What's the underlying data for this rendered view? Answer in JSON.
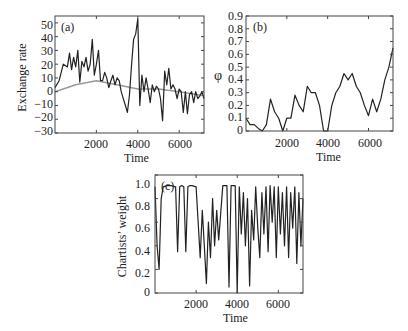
{
  "chart_data": [
    {
      "panel": "(a)",
      "type": "line",
      "xlabel": "Time",
      "ylabel": "Exchange rate",
      "xlim": [
        0,
        7200
      ],
      "ylim": [
        -30,
        55
      ],
      "xticks": [
        2000,
        4000,
        6000
      ],
      "yticks": [
        -30,
        -20,
        -10,
        0,
        10,
        20,
        30,
        40,
        50
      ],
      "grid": false,
      "series": [
        {
          "name": "exchange rate",
          "color": "#222222",
          "x": [
            0,
            200,
            400,
            600,
            700,
            800,
            900,
            1000,
            1100,
            1200,
            1300,
            1400,
            1500,
            1600,
            1700,
            1800,
            1900,
            2000,
            2100,
            2200,
            2300,
            2400,
            2500,
            2600,
            2700,
            2800,
            2900,
            3000,
            3100,
            3200,
            3300,
            3400,
            3500,
            3600,
            3700,
            3800,
            3900,
            4000,
            4100,
            4200,
            4300,
            4400,
            4500,
            4600,
            4700,
            4800,
            4900,
            5000,
            5100,
            5200,
            5300,
            5400,
            5500,
            5600,
            5700,
            5800,
            5900,
            6000,
            6100,
            6200,
            6300,
            6400,
            6500,
            6600,
            6700,
            6800,
            6900,
            7000,
            7100,
            7200
          ],
          "y": [
            3,
            8,
            20,
            18,
            28,
            16,
            25,
            18,
            30,
            7,
            22,
            18,
            25,
            15,
            20,
            38,
            12,
            20,
            30,
            8,
            8,
            14,
            10,
            3,
            8,
            12,
            5,
            10,
            8,
            0,
            -5,
            -10,
            -15,
            -2,
            20,
            38,
            42,
            53,
            -10,
            12,
            0,
            10,
            2,
            -8,
            5,
            0,
            4,
            2,
            -5,
            -21,
            15,
            5,
            17,
            2,
            5,
            2,
            -5,
            2,
            0,
            -15,
            0,
            -16,
            -2,
            0,
            -8,
            0,
            -5,
            -3,
            0,
            -5
          ]
        },
        {
          "name": "fundamental value",
          "color": "#999999",
          "x": [
            0,
            1000,
            2000,
            3000,
            4000,
            5000,
            6000,
            7200
          ],
          "y": [
            0,
            5,
            8,
            5,
            2,
            2,
            0,
            -3
          ]
        }
      ]
    },
    {
      "panel": "(b)",
      "type": "line",
      "xlabel": "Time",
      "ylabel": "φ",
      "xlim": [
        0,
        7200
      ],
      "ylim": [
        0,
        0.9
      ],
      "xticks": [
        2000,
        4000,
        6000
      ],
      "yticks": [
        0,
        0.1,
        0.2,
        0.3,
        0.4,
        0.5,
        0.6,
        0.7,
        0.8,
        0.9
      ],
      "grid": false,
      "series": [
        {
          "name": "phi",
          "color": "#222222",
          "x": [
            0,
            200,
            400,
            600,
            800,
            1000,
            1200,
            1400,
            1600,
            1800,
            2000,
            2200,
            2400,
            2600,
            2800,
            3000,
            3200,
            3400,
            3600,
            3800,
            4000,
            4200,
            4400,
            4600,
            4800,
            5000,
            5200,
            5400,
            5600,
            5800,
            6000,
            6200,
            6400,
            6600,
            6800,
            7000,
            7200
          ],
          "y": [
            0.1,
            0.05,
            0.05,
            0.02,
            0.0,
            0.05,
            0.25,
            0.15,
            0.1,
            0.0,
            0.1,
            0.1,
            0.28,
            0.2,
            0.15,
            0.35,
            0.3,
            0.3,
            0.2,
            0.0,
            0.0,
            0.2,
            0.3,
            0.35,
            0.45,
            0.4,
            0.45,
            0.35,
            0.3,
            0.2,
            0.12,
            0.25,
            0.15,
            0.25,
            0.4,
            0.5,
            0.65
          ]
        }
      ]
    },
    {
      "panel": "(c)",
      "type": "line",
      "xlabel": "Time",
      "ylabel": "Chartists' weight",
      "xlim": [
        0,
        7200
      ],
      "ylim": [
        0,
        1.0
      ],
      "xticks": [
        2000,
        4000,
        6000
      ],
      "yticks": [
        0,
        0.2,
        0.4,
        0.6,
        0.8,
        1.0
      ],
      "grid": false,
      "series": [
        {
          "name": "chartists weight",
          "color": "#222222",
          "x": [
            0,
            100,
            200,
            300,
            400,
            600,
            800,
            1000,
            1100,
            1200,
            1300,
            1400,
            1500,
            1600,
            1700,
            1800,
            2000,
            2200,
            2300,
            2400,
            2500,
            2600,
            2700,
            2800,
            2900,
            3000,
            3100,
            3300,
            3500,
            3600,
            3700,
            3800,
            3900,
            4000,
            4100,
            4200,
            4300,
            4400,
            4500,
            4600,
            4700,
            4800,
            4900,
            5000,
            5100,
            5200,
            5300,
            5400,
            5500,
            5600,
            5700,
            5800,
            5900,
            6000,
            6100,
            6200,
            6300,
            6400,
            6500,
            6600,
            6700,
            6800,
            6900,
            7000,
            7100,
            7200
          ],
          "y": [
            0.9,
            0.4,
            0.2,
            0.8,
            0.9,
            0.91,
            0.91,
            0.9,
            0.35,
            0.9,
            0.91,
            0.9,
            0.35,
            0.9,
            0.91,
            0.91,
            0.9,
            0.3,
            0.7,
            0.4,
            0.08,
            0.6,
            0.3,
            0.8,
            0.4,
            0.7,
            0.45,
            0.91,
            0.91,
            0.05,
            0.91,
            0.91,
            0.91,
            0.0,
            0.9,
            0.5,
            0.85,
            0.4,
            0.8,
            0.06,
            0.7,
            0.45,
            0.9,
            0.55,
            0.3,
            0.85,
            0.5,
            0.9,
            0.35,
            0.91,
            0.6,
            0.9,
            0.3,
            0.9,
            0.5,
            0.85,
            0.4,
            0.9,
            0.3,
            0.85,
            0.55,
            0.9,
            0.25,
            0.85,
            0.4,
            0.8
          ]
        }
      ]
    }
  ],
  "panels": {
    "a": {
      "tag": "(a)",
      "xlabel": "Time",
      "ylabel": "Exchange rate",
      "xticks": [
        "2000",
        "4000",
        "6000"
      ],
      "yticks": [
        "50",
        "40",
        "30",
        "20",
        "10",
        "0",
        "−10",
        "−20",
        "−30"
      ]
    },
    "b": {
      "tag": "(b)",
      "xlabel": "Time",
      "ylabel": "φ",
      "xticks": [
        "2000",
        "4000",
        "6000"
      ],
      "yticks": [
        "0.9",
        "0.8",
        "0.7",
        "0.6",
        "0.5",
        "0.4",
        "0.3",
        "0.2",
        "0.1",
        "0"
      ]
    },
    "c": {
      "tag": "(c)",
      "xlabel": "Time",
      "ylabel": "Chartists’ weight",
      "xticks": [
        "2000",
        "4000",
        "6000"
      ],
      "yticks": [
        "1.0",
        "0.8",
        "0.6",
        "0.4",
        "0.2",
        "0"
      ]
    }
  }
}
